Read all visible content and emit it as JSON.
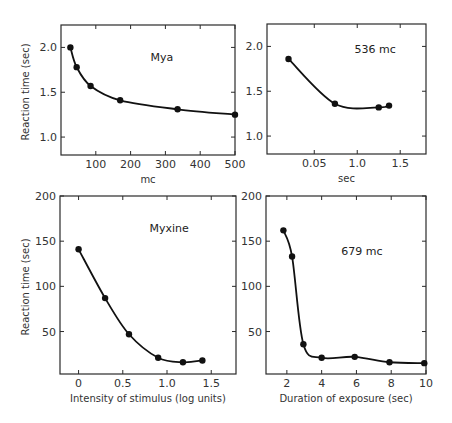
{
  "chart_data": [
    {
      "id": "mya-intensity",
      "type": "line",
      "title": "",
      "annotation": "Mya",
      "xlabel": "mc",
      "ylabel": "Reaction time (sec)",
      "xlim": [
        0,
        500
      ],
      "ylim": [
        0.8,
        2.25
      ],
      "xticks": [
        100,
        200,
        300,
        400,
        500
      ],
      "xtick_labels": [
        "100",
        "200",
        "300",
        "400",
        "500"
      ],
      "yticks": [
        1.0,
        1.5,
        2.0
      ],
      "ytick_labels": [
        "1.0",
        "1.5",
        "2.0"
      ],
      "grid": false,
      "series": [
        {
          "name": "Mya",
          "x": [
            27,
            45,
            85,
            170,
            335,
            500
          ],
          "y": [
            2.0,
            1.78,
            1.57,
            1.41,
            1.31,
            1.25
          ]
        }
      ],
      "box": {
        "left": 61,
        "top": 25,
        "right": 235,
        "bottom": 155
      }
    },
    {
      "id": "mya-duration",
      "type": "line",
      "title": "",
      "annotation": "536 mc",
      "xlabel": "sec",
      "ylabel": "",
      "xlim": [
        -0.05,
        1.8
      ],
      "ylim": [
        0.8,
        2.25
      ],
      "xticks": [
        0.5,
        1.0,
        1.5
      ],
      "xtick_labels": [
        "0.05",
        "1.0",
        "1.5"
      ],
      "yticks": [
        1.0,
        1.5,
        2.0
      ],
      "ytick_labels": [
        "1.0",
        "1.5",
        "2.0"
      ],
      "grid": false,
      "series": [
        {
          "name": "536 mc",
          "x": [
            0.2,
            0.74,
            1.25,
            1.37
          ],
          "y": [
            1.86,
            1.36,
            1.32,
            1.34
          ]
        }
      ],
      "box": {
        "left": 267,
        "top": 24,
        "right": 426,
        "bottom": 154
      }
    },
    {
      "id": "myxine-intensity",
      "type": "line",
      "title": "",
      "annotation": "Myxine",
      "xlabel": "Intensity of stimulus (log units)",
      "ylabel": "Reaction time (sec)",
      "xlim": [
        -0.21,
        1.78
      ],
      "ylim": [
        3,
        200
      ],
      "xticks": [
        0,
        0.5,
        1.0,
        1.5
      ],
      "xtick_labels": [
        "0",
        "0.5",
        "1.0",
        "1.5"
      ],
      "yticks": [
        50,
        100,
        150,
        200
      ],
      "ytick_labels": [
        "50",
        "100",
        "150",
        "200"
      ],
      "grid": false,
      "series": [
        {
          "name": "Myxine",
          "x": [
            0,
            0.3,
            0.57,
            0.9,
            1.18,
            1.4
          ],
          "y": [
            141,
            87,
            47,
            21,
            16,
            18
          ]
        }
      ],
      "box": {
        "left": 60,
        "top": 196,
        "right": 236,
        "bottom": 374
      }
    },
    {
      "id": "myxine-duration",
      "type": "line",
      "title": "",
      "annotation": "679 mc",
      "xlabel": "Duration of exposure (sec)",
      "ylabel": "",
      "xlim": [
        0.8,
        10
      ],
      "ylim": [
        3,
        200
      ],
      "xticks": [
        2,
        4,
        6,
        8,
        10
      ],
      "xtick_labels": [
        "2",
        "4",
        "6",
        "8",
        "10"
      ],
      "yticks": [
        50,
        100,
        150,
        200
      ],
      "ytick_labels": [
        "50",
        "100",
        "150",
        "200"
      ],
      "grid": false,
      "series": [
        {
          "name": "679 mc",
          "x": [
            1.8,
            2.3,
            2.95,
            4.0,
            5.9,
            7.9,
            9.9
          ],
          "y": [
            162,
            133,
            36,
            21,
            22,
            16,
            15
          ]
        }
      ],
      "box": {
        "left": 266,
        "top": 196,
        "right": 426,
        "bottom": 374
      }
    }
  ],
  "figure": {
    "shared_ylabel_top": "Reaction time (sec)",
    "shared_ylabel_bottom": "Reaction time (sec)"
  }
}
